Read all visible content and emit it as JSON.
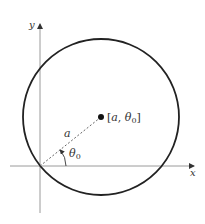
{
  "diagram": {
    "axes": {
      "x_label": "x",
      "y_label": "y"
    },
    "point_label": {
      "open": "[",
      "a": "a",
      "comma": ", ",
      "theta": "θ",
      "sub": "0",
      "close": "]"
    },
    "radius_label": "a",
    "angle_label": {
      "theta": "θ",
      "sub": "0"
    },
    "colors": {
      "stroke": "#222222",
      "axis": "#999999",
      "text": "#333333"
    }
  }
}
